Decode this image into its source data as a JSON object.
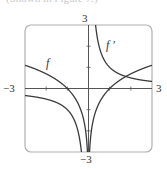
{
  "caption_fragment": "(Shown in Figure 7.)",
  "chart_data": {
    "type": "line",
    "title": "",
    "xlabel": "",
    "ylabel": "",
    "xlim": [
      -3,
      3
    ],
    "ylim": [
      -3,
      3
    ],
    "grid": false,
    "legend": "inline curve labels",
    "tick_labels": {
      "x_min": "−3",
      "x_max": "3",
      "y_min": "−3",
      "y_max": "3"
    },
    "series": [
      {
        "name": "f",
        "label": "f",
        "expression": "ln|x|",
        "x": [
          -3,
          -2.5,
          -2,
          -1.5,
          -1,
          -0.75,
          -0.5,
          -0.3,
          -0.2,
          -0.1,
          -0.05,
          0.05,
          0.1,
          0.2,
          0.3,
          0.5,
          0.75,
          1,
          1.5,
          2,
          2.5,
          3
        ],
        "y": [
          1.1,
          0.92,
          0.69,
          0.41,
          0,
          -0.29,
          -0.69,
          -1.2,
          -1.61,
          -2.3,
          -3.0,
          -3.0,
          -2.3,
          -1.61,
          -1.2,
          -0.69,
          -0.29,
          0,
          0.41,
          0.69,
          0.92,
          1.1
        ]
      },
      {
        "name": "f'",
        "label": "f ′",
        "expression": "1/x",
        "x": [
          -3,
          -2.5,
          -2,
          -1.5,
          -1,
          -0.75,
          -0.5,
          -0.4,
          -0.34,
          0.34,
          0.4,
          0.5,
          0.75,
          1,
          1.5,
          2,
          2.5,
          3
        ],
        "y": [
          -0.33,
          -0.4,
          -0.5,
          -0.67,
          -1.0,
          -1.33,
          -2.0,
          -2.5,
          -3.0,
          3.0,
          2.5,
          2.0,
          1.33,
          1.0,
          0.67,
          0.5,
          0.4,
          0.33
        ]
      }
    ],
    "colors": {
      "frame": "#b0b0b0",
      "axes": "#555555",
      "curves": "#3a3a3a",
      "text": "#333333"
    }
  }
}
